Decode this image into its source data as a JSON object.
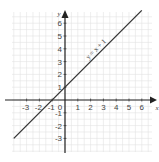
{
  "chart_data": {
    "type": "line",
    "title": "",
    "xlabel": "x",
    "ylabel": "y",
    "xlim": [
      -3.5,
      7
    ],
    "ylim": [
      -4,
      7
    ],
    "grid": true,
    "x_ticks": [
      -3,
      -2,
      -1,
      0,
      1,
      2,
      3,
      4,
      5,
      6
    ],
    "y_ticks": [
      -3,
      -2,
      -1,
      1,
      2,
      3,
      4,
      5,
      6
    ],
    "x_tick_labels": [
      "-3",
      "-2",
      "-1",
      "0",
      "1",
      "2",
      "3",
      "4",
      "5",
      "6"
    ],
    "y_tick_labels": [
      "-3",
      "-2",
      "-1",
      "1",
      "2",
      "3",
      "4",
      "5",
      "6"
    ],
    "series": [
      {
        "name": "y = x + 1",
        "equation": "y = x + 1",
        "x": [
          -4,
          6
        ],
        "y": [
          -3,
          7
        ]
      }
    ],
    "annotations": [
      {
        "text": "y = x + 1",
        "x": 3,
        "y": 4,
        "rotation": -45
      }
    ]
  },
  "style": {
    "grid_color": "#e2e2e2",
    "axis_color": "#222222",
    "line_color": "#333333"
  }
}
